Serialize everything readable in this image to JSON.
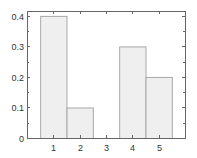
{
  "chart_data": {
    "type": "bar",
    "title": "",
    "xlabel": "",
    "ylabel": "",
    "categories": [
      "1",
      "2",
      "3",
      "4",
      "5"
    ],
    "x": [
      1,
      2,
      3,
      4,
      5
    ],
    "values": [
      0.4,
      0.1,
      0.0,
      0.3,
      0.2
    ],
    "xlim": [
      0,
      6
    ],
    "ylim": [
      0,
      0.416
    ],
    "xticks": [
      1,
      2,
      3,
      4,
      5
    ],
    "xtick_labels": [
      "1",
      "2",
      "3",
      "4",
      "5"
    ],
    "yticks": [
      0,
      0.1,
      0.2,
      0.3,
      0.4
    ],
    "ytick_labels": [
      "0",
      "0.1",
      "0.2",
      "0.3",
      "0.4"
    ],
    "bar_width": 1.0,
    "grid": false,
    "legend": null,
    "colors": {
      "bar_fill": "#efefef",
      "bar_edge": "#a8a8a8",
      "axis": "#666666",
      "text": "#333333"
    }
  },
  "layout": {
    "plot_left": 27,
    "plot_top": 11,
    "plot_right": 185,
    "plot_bottom": 138
  }
}
